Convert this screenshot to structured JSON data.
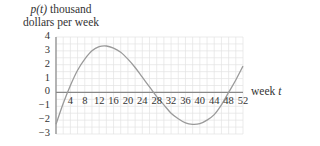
{
  "chart_data": {
    "type": "line",
    "title": "",
    "ylabel": "p(t) thousand dollars per week",
    "ylabel_lines": [
      "p(t) thousand",
      "dollars per week"
    ],
    "xlabel": "week t",
    "xlim": [
      0,
      52
    ],
    "ylim": [
      -3,
      4
    ],
    "grid": true,
    "x_ticks": [
      4,
      8,
      12,
      16,
      20,
      24,
      28,
      32,
      36,
      40,
      44,
      48,
      52
    ],
    "y_ticks": [
      4,
      3,
      2,
      1,
      0,
      -1,
      -2,
      -3
    ],
    "series": [
      {
        "name": "p(t)",
        "x": [
          0,
          2,
          4,
          6,
          8,
          10,
          12,
          14,
          16,
          18,
          20,
          22,
          24,
          26,
          28,
          30,
          32,
          34,
          36,
          38,
          40,
          42,
          44,
          46,
          48,
          50,
          52
        ],
        "y": [
          -2.3,
          -0.8,
          0.5,
          1.6,
          2.4,
          3.0,
          3.3,
          3.35,
          3.2,
          2.9,
          2.4,
          1.8,
          1.1,
          0.4,
          -0.3,
          -0.9,
          -1.5,
          -1.9,
          -2.2,
          -2.3,
          -2.25,
          -2.0,
          -1.6,
          -0.9,
          0.0,
          0.9,
          1.9
        ]
      }
    ]
  },
  "labels": {
    "ylabel_prefix": "p",
    "ylabel_var": "(t)",
    "ylabel_line1_rest": " thousand",
    "ylabel_line2": "dollars per week",
    "xlabel_text": "week ",
    "xlabel_var": "t"
  },
  "colors": {
    "grid": "#e3e3e3",
    "axis": "#888888",
    "curve": "#9a9a9a",
    "text": "#333333"
  }
}
